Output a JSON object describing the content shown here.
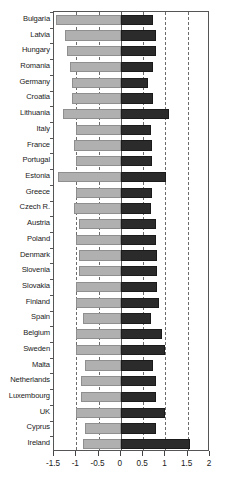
{
  "chart_data": {
    "type": "bar",
    "orientation": "horizontal",
    "title": "",
    "xlabel": "",
    "ylabel": "",
    "xlim": [
      -1.5,
      2
    ],
    "grid": "dashed vertical gridlines at -1, -0.5, 0.5, 1, 1.5",
    "zero_line": 0,
    "xticks": [
      -1.5,
      -1,
      -0.5,
      0,
      0.5,
      1,
      1.5,
      2
    ],
    "xticklabels": [
      "-1.5",
      "-1",
      "-0.5",
      "0",
      "0.5",
      "1",
      "1.5",
      "2"
    ],
    "legend": null,
    "categories": [
      "Bulgaria",
      "Latvia",
      "Hungary",
      "Romania",
      "Germany",
      "Croatia",
      "Lithuania",
      "Italy",
      "France",
      "Portugal",
      "Estonia",
      "Greece",
      "Czech R.",
      "Austria",
      "Poland",
      "Denmark",
      "Slovenia",
      "Slovakia",
      "Finland",
      "Spain",
      "Belgium",
      "Sweden",
      "Malta",
      "Netherlands",
      "Luxembourg",
      "UK",
      "Cyprus",
      "Ireland"
    ],
    "series": [
      {
        "name": "negative",
        "color": "#b0b0b0",
        "values": [
          -1.45,
          -1.25,
          -1.2,
          -1.15,
          -1.1,
          -1.1,
          -1.3,
          -1.0,
          -1.05,
          -1.0,
          -1.4,
          -1.0,
          -1.05,
          -0.95,
          -1.0,
          -0.95,
          -0.95,
          -1.0,
          -1.0,
          -0.85,
          -1.0,
          -1.0,
          -0.8,
          -0.9,
          -0.9,
          -1.0,
          -0.8,
          -0.85
        ]
      },
      {
        "name": "positive",
        "color": "#2b2b2b",
        "values": [
          0.72,
          0.78,
          0.78,
          0.72,
          0.62,
          0.72,
          1.08,
          0.68,
          0.7,
          0.7,
          1.02,
          0.7,
          0.68,
          0.78,
          0.78,
          0.82,
          0.8,
          0.82,
          0.85,
          0.68,
          0.92,
          0.98,
          0.72,
          0.78,
          0.78,
          1.0,
          0.78,
          1.55
        ]
      }
    ]
  },
  "axis": {
    "left_value": -1.5,
    "right_value": 2
  }
}
